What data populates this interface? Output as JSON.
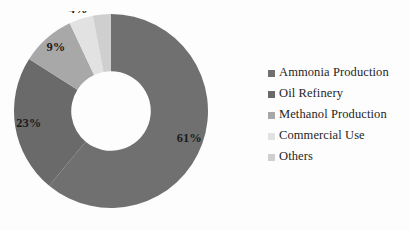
{
  "chart_data": {
    "type": "pie",
    "variant": "donut",
    "title": "",
    "xlabel": "",
    "ylabel": "",
    "grid": false,
    "legend_position": "right",
    "start_angle_deg": 0,
    "direction": "clockwise",
    "inner_radius_ratio": 0.41,
    "categories": [
      "Ammonia Production",
      "Oil Refinery",
      "Methanol Production",
      "Commercial Use",
      "Others"
    ],
    "values": [
      61,
      23,
      9,
      4,
      3
    ],
    "data_labels": [
      "61%",
      "23%",
      "9%",
      "4%",
      "3%"
    ],
    "colors": [
      "#707070",
      "#6a6a6a",
      "#a8a8a8",
      "#e2e2e2",
      "#cfcfcf"
    ],
    "units": "percent"
  },
  "legend": {
    "items": [
      {
        "label": "Ammonia Production",
        "color": "#707070"
      },
      {
        "label": "Oil Refinery",
        "color": "#6a6a6a"
      },
      {
        "label": "Methanol Production",
        "color": "#a8a8a8"
      },
      {
        "label": "Commercial Use",
        "color": "#e2e2e2"
      },
      {
        "label": "Others",
        "color": "#cfcfcf"
      }
    ]
  },
  "slice_labels": {
    "ammonia": "61%",
    "oil_refinery": "23%",
    "methanol": "9%",
    "commercial": "4%",
    "others": "3%"
  }
}
